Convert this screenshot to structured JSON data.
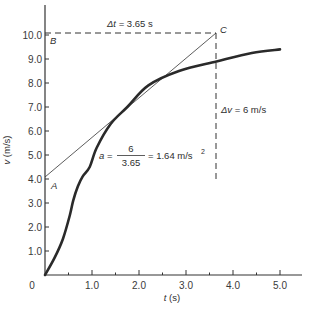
{
  "chart_data": {
    "type": "line",
    "title": "",
    "xlabel": "t (s)",
    "ylabel": "v (m/s)",
    "xlim": [
      0,
      5.4
    ],
    "ylim": [
      0,
      10.9
    ],
    "grid": false,
    "x_ticks": [
      0,
      1.0,
      2.0,
      3.0,
      4.0,
      5.0
    ],
    "x_tick_labels": [
      "0",
      "1.0",
      "2.0",
      "3.0",
      "4.0",
      "5.0"
    ],
    "x_minor_ticks": [
      0.5,
      1.5,
      2.5,
      3.5,
      4.5
    ],
    "y_ticks": [
      1.0,
      2.0,
      3.0,
      4.0,
      5.0,
      6.0,
      7.0,
      8.0,
      9.0,
      10.0
    ],
    "y_tick_labels": [
      "1.0",
      "2.0",
      "3.0",
      "4.0",
      "5.0",
      "6.0",
      "7.0",
      "8.0",
      "9.0",
      "10.0"
    ],
    "series": [
      {
        "name": "velocity curve",
        "x": [
          0,
          0.2,
          0.38,
          0.53,
          0.6,
          0.7,
          0.8,
          0.95,
          1.1,
          1.4,
          1.75,
          2.2,
          2.85,
          3.65,
          4.4,
          5.0
        ],
        "y": [
          0,
          0.7,
          1.5,
          2.5,
          3.1,
          3.7,
          4.1,
          4.5,
          5.3,
          6.3,
          7.0,
          7.9,
          8.5,
          8.9,
          9.25,
          9.4
        ]
      },
      {
        "name": "tangent line",
        "x": [
          0,
          3.65
        ],
        "y": [
          4.0,
          10.0
        ]
      }
    ],
    "points": [
      {
        "label": "A",
        "x": 0,
        "y": 4.0
      },
      {
        "label": "B",
        "x": 0,
        "y": 10.0
      },
      {
        "label": "C",
        "x": 3.65,
        "y": 10.0
      }
    ],
    "annotations": [
      {
        "text": "Δt = 3.65 s",
        "at": [
          1.9,
          10.4
        ]
      },
      {
        "text": "Δv = 6 m/s",
        "at": [
          3.75,
          6.8
        ]
      },
      {
        "text": "a = 6 / 3.65 = 1.64 m/s²",
        "at": [
          1.5,
          5.3
        ]
      }
    ],
    "dashed_lines": [
      {
        "from": [
          0,
          10.0
        ],
        "to": [
          3.65,
          10.0
        ]
      },
      {
        "from": [
          3.65,
          10.0
        ],
        "to": [
          3.65,
          3.9
        ]
      }
    ]
  },
  "labels": {
    "xlabel_var": "t",
    "xlabel_unit": " (s)",
    "ylabel_var": "v",
    "ylabel_unit": " (m/s)",
    "point_a": "A",
    "point_b": "B",
    "point_c": "C",
    "delta_t_sym": "Δt",
    "delta_t_val": " = 3.65 s",
    "delta_v_sym": "Δv",
    "delta_v_val": " = 6 m/s",
    "accel_lhs": "a",
    "accel_eq": "=",
    "accel_num": "6",
    "accel_den": "3.65",
    "accel_rhs": "= 1.64 m/s",
    "accel_sup": "2"
  }
}
